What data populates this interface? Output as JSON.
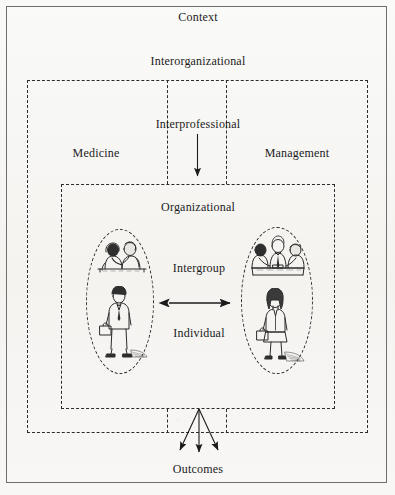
{
  "figure": {
    "title_label": "Context",
    "levels": [
      {
        "key": "context",
        "label": "Context"
      },
      {
        "key": "interorganizational",
        "label": "Interorganizational"
      },
      {
        "key": "interprofessional",
        "label": "Interprofessional"
      },
      {
        "key": "organizational",
        "label": "Organizational"
      },
      {
        "key": "intergroup",
        "label": "Intergroup"
      },
      {
        "key": "individual",
        "label": "Individual"
      }
    ],
    "domains": {
      "left_label": "Medicine",
      "right_label": "Management"
    },
    "outcome_label": "Outcomes",
    "arrows": {
      "interprofessional_down": "downward-arrow",
      "intergroup_bidirectional": "double-headed-arrow",
      "outcomes_fan": "three-fanning-arrows"
    },
    "illustrations": {
      "left_group": "two-people-talking",
      "left_individual": "man-with-briefcase",
      "right_group": "three-people-meeting",
      "right_individual": "woman-with-briefcase"
    },
    "colors": {
      "background": "#f7f6f4",
      "ink": "#1b1b1b",
      "frame": "#6e6e6e",
      "dashed": "#2b2b2b"
    }
  }
}
